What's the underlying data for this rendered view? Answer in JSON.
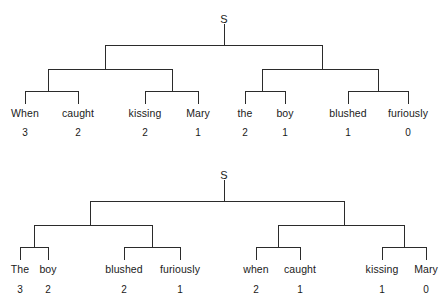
{
  "figure": {
    "background_color": "#ffffff",
    "line_color": "#2b2b2b",
    "text_color": "#1a1a1a"
  },
  "trees": [
    {
      "id": "tree-top",
      "root_label": "S",
      "root_x": 224,
      "root_label_y": 14,
      "root_stem_top_y": 24,
      "level1_y": 45,
      "level1_left_x": 105,
      "level1_right_x": 322,
      "level2_y": 69,
      "level2_bars": [
        {
          "left_x": 48,
          "right_x": 172,
          "parent_x": 105
        },
        {
          "left_x": 262,
          "right_x": 378,
          "parent_x": 322
        }
      ],
      "level3_y": 91,
      "level3_bars": [
        {
          "left_x": 25,
          "right_x": 78,
          "parent_x": 48
        },
        {
          "left_x": 145,
          "right_x": 198,
          "parent_x": 172
        },
        {
          "left_x": 245,
          "right_x": 285,
          "parent_x": 262
        },
        {
          "left_x": 348,
          "right_x": 408,
          "parent_x": 378
        }
      ],
      "leaf_stem_bottom_y": 104,
      "word_y": 108,
      "num_y": 128,
      "leaves": [
        {
          "word": "When",
          "number": "3",
          "x": 25
        },
        {
          "word": "caught",
          "number": "2",
          "x": 78
        },
        {
          "word": "kissing",
          "number": "2",
          "x": 145
        },
        {
          "word": "Mary",
          "number": "1",
          "x": 198
        },
        {
          "word": "the",
          "number": "2",
          "x": 245
        },
        {
          "word": "boy",
          "number": "1",
          "x": 285
        },
        {
          "word": "blushed",
          "number": "1",
          "x": 348
        },
        {
          "word": "furiously",
          "number": "0",
          "x": 408
        }
      ]
    },
    {
      "id": "tree-bottom",
      "root_label": "S",
      "root_x": 224,
      "root_label_y": 170,
      "root_stem_top_y": 180,
      "level1_y": 201,
      "level1_left_x": 90,
      "level1_right_x": 344,
      "level2_y": 225,
      "level2_bars": [
        {
          "left_x": 34,
          "right_x": 152,
          "parent_x": 90
        },
        {
          "left_x": 278,
          "right_x": 404,
          "parent_x": 344
        }
      ],
      "level3_y": 247,
      "level3_bars": [
        {
          "left_x": 20,
          "right_x": 48,
          "parent_x": 34
        },
        {
          "left_x": 124,
          "right_x": 180,
          "parent_x": 152
        },
        {
          "left_x": 256,
          "right_x": 300,
          "parent_x": 278
        },
        {
          "left_x": 382,
          "right_x": 426,
          "parent_x": 404
        }
      ],
      "leaf_stem_bottom_y": 260,
      "word_y": 264,
      "num_y": 285,
      "leaves": [
        {
          "word": "The",
          "number": "3",
          "x": 20
        },
        {
          "word": "boy",
          "number": "2",
          "x": 48
        },
        {
          "word": "blushed",
          "number": "2",
          "x": 124
        },
        {
          "word": "furiously",
          "number": "1",
          "x": 180
        },
        {
          "word": "when",
          "number": "2",
          "x": 256
        },
        {
          "word": "caught",
          "number": "1",
          "x": 300
        },
        {
          "word": "kissing",
          "number": "1",
          "x": 382
        },
        {
          "word": "Mary",
          "number": "0",
          "x": 426
        }
      ]
    }
  ]
}
